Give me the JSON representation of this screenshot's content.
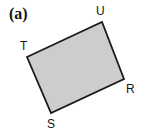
{
  "figure": {
    "panel_label": "(a)",
    "background_color": "#ffffff",
    "width": 145,
    "height": 136
  },
  "shape": {
    "name": "quadrilateral",
    "fill_color": "#cdcdcd",
    "stroke_color": "#1a1a1a",
    "stroke_width": 1.8,
    "points": "27,57 102,22 124,79 51,113"
  },
  "vertices": [
    {
      "label": "T",
      "x": 27,
      "y": 57
    },
    {
      "label": "U",
      "x": 102,
      "y": 22
    },
    {
      "label": "R",
      "x": 124,
      "y": 79
    },
    {
      "label": "S",
      "x": 51,
      "y": 113
    }
  ]
}
